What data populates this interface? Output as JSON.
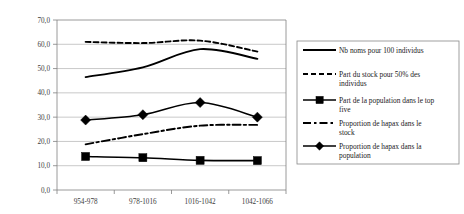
{
  "chart_data": {
    "type": "line",
    "title": "",
    "xlabel": "",
    "ylabel": "",
    "categories": [
      "954-978",
      "978-1016",
      "1016-1042",
      "1042-1066"
    ],
    "ylim": [
      0.0,
      70.0
    ],
    "ytick_labels": [
      "70,0",
      "60,0",
      "50,0",
      "40,0",
      "30,0",
      "20,0",
      "10,0",
      "0,0"
    ],
    "ytick_values": [
      70.0,
      60.0,
      50.0,
      40.0,
      30.0,
      20.0,
      10.0,
      0.0
    ],
    "grid": true,
    "legend_position": "right",
    "series": [
      {
        "name": "Nb noms pour 100 individus",
        "style": "solid",
        "marker": "none",
        "values": [
          46.5,
          50.5,
          58.0,
          54.0
        ]
      },
      {
        "name": "Part du stock pour 50% des individus",
        "style": "dashed",
        "marker": "none",
        "values": [
          61.0,
          60.5,
          61.5,
          57.0
        ]
      },
      {
        "name": "Part de la population dans le top five",
        "style": "solid",
        "marker": "square",
        "values": [
          13.8,
          13.3,
          12.2,
          12.1
        ]
      },
      {
        "name": "Proportion de hapax dans le stock",
        "style": "dash-dot",
        "marker": "none",
        "values": [
          18.8,
          23.0,
          26.5,
          26.8
        ]
      },
      {
        "name": "Proportion de hapax dans la population",
        "style": "solid",
        "marker": "diamond",
        "values": [
          28.8,
          31.0,
          36.0,
          30.0
        ]
      }
    ]
  },
  "legend": {
    "items": [
      {
        "label": "Nb noms pour 100 individus"
      },
      {
        "label": "Part du stock pour 50% des individus"
      },
      {
        "label": "Part de la population dans le top five"
      },
      {
        "label": "Proportion de hapax dans le stock"
      },
      {
        "label": "Proportion de hapax dans la population"
      }
    ]
  },
  "colors": {
    "series": "#000000",
    "grid": "#b0b0b0",
    "axis": "#808080",
    "text": "#1a1a1a",
    "background": "#ffffff"
  }
}
